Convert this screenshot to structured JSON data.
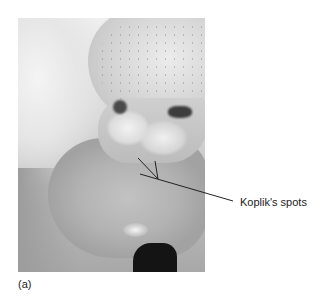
{
  "figure": {
    "panel_label": "(a)",
    "annotation": {
      "label": "Koplik's spots",
      "pointer_lines": [
        {
          "x1": 138,
          "y1": 158,
          "x2": 158,
          "y2": 179
        },
        {
          "x1": 155,
          "y1": 161,
          "x2": 158,
          "y2": 179
        },
        {
          "x1": 140,
          "y1": 174,
          "x2": 233,
          "y2": 201
        }
      ],
      "line_color": "#222222"
    },
    "photo": {
      "description": "grayscale clinical photograph of buccal mucosa with teeth",
      "colors": {
        "background": "#ffffff",
        "dark": "#141414",
        "light": "#f0f0f0"
      }
    }
  }
}
